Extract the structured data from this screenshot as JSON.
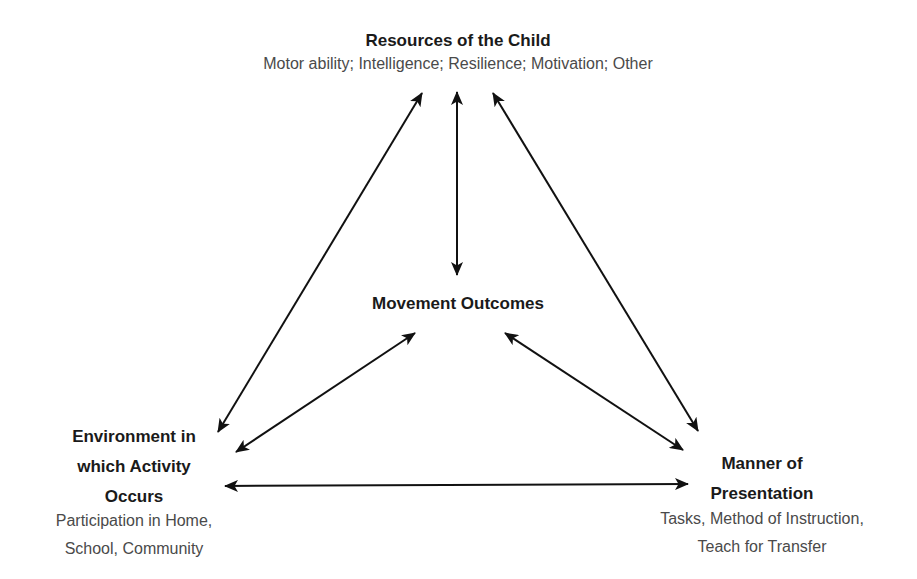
{
  "diagram": {
    "colors": {
      "title": "#1a1a1a",
      "description": "#4a4a4a",
      "arrow": "#111111",
      "background": "#ffffff"
    },
    "nodes": {
      "resources": {
        "title": "Resources of the Child",
        "description": "Motor ability; Intelligence; Resilience; Motivation; Other"
      },
      "outcomes": {
        "title": "Movement Outcomes"
      },
      "environment": {
        "title_lines": [
          "Environment in",
          "which Activity",
          "Occurs"
        ],
        "description_lines": [
          "Participation in Home,",
          "School, Community"
        ]
      },
      "manner": {
        "title_lines": [
          "Manner of",
          "Presentation"
        ],
        "description_lines": [
          "Tasks, Method of Instruction,",
          "Teach for Transfer"
        ]
      }
    },
    "connections": [
      {
        "from": "Resources of the Child",
        "to": "Environment in which Activity Occurs",
        "type": "bidirectional-arrow"
      },
      {
        "from": "Resources of the Child",
        "to": "Movement Outcomes",
        "type": "bidirectional-arrow"
      },
      {
        "from": "Resources of the Child",
        "to": "Manner of Presentation",
        "type": "bidirectional-arrow"
      },
      {
        "from": "Movement Outcomes",
        "to": "Environment in which Activity Occurs",
        "type": "bidirectional-arrow"
      },
      {
        "from": "Movement Outcomes",
        "to": "Manner of Presentation",
        "type": "bidirectional-arrow"
      },
      {
        "from": "Environment in which Activity Occurs",
        "to": "Manner of Presentation",
        "type": "bidirectional-arrow"
      }
    ]
  }
}
